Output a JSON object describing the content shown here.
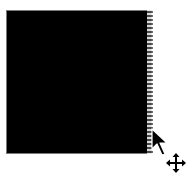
{
  "canvas": {
    "shape": "rectangle",
    "fill_color": "#000000",
    "border_color": "#7a7a7a"
  },
  "selection": {
    "edge": "right",
    "style": "dotted-marquee"
  },
  "cursor": {
    "type": "arrow-with-move-badge",
    "icon": "move-icon"
  }
}
